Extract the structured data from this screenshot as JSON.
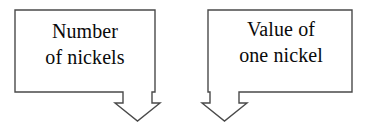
{
  "diagram": {
    "type": "flow-diagram",
    "stroke_color": "#4a4a4a",
    "text_color": "#0a0a0a",
    "background_color": "#ffffff",
    "nodes": [
      {
        "id": "number-of-nickels",
        "label_lines": [
          "Number",
          "of nickels"
        ],
        "box": {
          "x": 15,
          "y": 10,
          "width": 140,
          "height": 82
        },
        "arrow": {
          "direction": "down",
          "attached_edge": "bottom-right",
          "stem_x": 123,
          "stem_width": 29,
          "tip_y": 120
        }
      },
      {
        "id": "value-of-one-nickel",
        "label_lines": [
          "Value of",
          "one nickel"
        ],
        "box": {
          "x": 208,
          "y": 10,
          "width": 144,
          "height": 82
        },
        "arrow": {
          "direction": "down",
          "attached_edge": "bottom-left",
          "stem_x": 210,
          "stem_width": 29,
          "tip_y": 120
        }
      }
    ]
  }
}
